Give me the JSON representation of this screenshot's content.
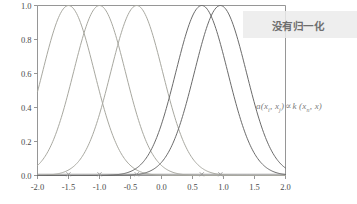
{
  "chart_data": {
    "type": "line",
    "title": "",
    "xlabel": "",
    "ylabel": "",
    "xlim": [
      -2.0,
      2.0
    ],
    "ylim": [
      0.0,
      1.0
    ],
    "grid": false,
    "legend": "none",
    "xticks": [
      "-2.0",
      "-1.5",
      "-1.0",
      "-0.5",
      "0.0",
      "0.5",
      "1.0",
      "1.5",
      "2.0"
    ],
    "xtick_values": [
      -2.0,
      -1.5,
      -1.0,
      -0.5,
      0.0,
      0.5,
      1.0,
      1.5,
      2.0
    ],
    "yticks": [
      "0.0",
      "0.2",
      "0.4",
      "0.6",
      "0.8",
      "1.0"
    ],
    "ytick_values": [
      0.0,
      0.2,
      0.4,
      0.6,
      0.8,
      1.0
    ],
    "series": [
      {
        "name": "kernel-1",
        "center": -1.5,
        "width": 0.42,
        "peak": 1.0,
        "color": "#a8a8a0"
      },
      {
        "name": "kernel-2",
        "center": -1.0,
        "width": 0.42,
        "peak": 1.0,
        "color": "#a8a8a0"
      },
      {
        "name": "kernel-3",
        "center": -0.4,
        "width": 0.42,
        "peak": 1.0,
        "color": "#a8a8a0"
      },
      {
        "name": "kernel-4",
        "center": 0.65,
        "width": 0.42,
        "peak": 1.0,
        "color": "#6b6b6b"
      },
      {
        "name": "kernel-5",
        "center": 0.95,
        "width": 0.42,
        "peak": 1.0,
        "color": "#6b6b6b"
      }
    ],
    "markers": {
      "name": "center-markers",
      "y": 0.0,
      "x": [
        -1.5,
        -1.0,
        -0.4,
        0.65,
        0.95
      ],
      "color": "#9a9a9a"
    },
    "baseline": {
      "y": 0.0,
      "x_start": -2.0,
      "x_end": 2.0,
      "color": "#9a9a9a"
    },
    "annotations": [
      {
        "name": "watermark",
        "text": "没有归一化",
        "position": "top-right"
      },
      {
        "name": "formula",
        "text": "a(x., x.) ∝ k (x., x)",
        "position": "right-middle"
      }
    ]
  },
  "watermark": {
    "text": "没有归一化",
    "background_color": "#ebebeb",
    "text_color": "#6e6e6e"
  },
  "formula": {
    "a": "a",
    "open1": "(",
    "x1": "x",
    "sub1": "i",
    "comma": ", ",
    "x2": "x",
    "sub2": "j",
    "close1": ")",
    "prop": "∝",
    "k": "k",
    "open2": " (",
    "x3": "x",
    "sub3": "n",
    "comma2": ", ",
    "x4": "x",
    "close2": ")"
  },
  "axes": {
    "border_color": "#8a8a8a",
    "tick_color": "#8a8a8a",
    "label_color": "#4a4a4a"
  }
}
